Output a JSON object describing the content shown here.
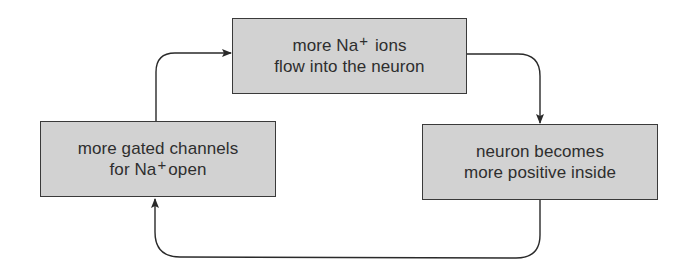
{
  "diagram": {
    "type": "positive-feedback-cycle",
    "nodes": [
      {
        "id": "top",
        "line1_pre": "more Na",
        "line1_sup": "+",
        "line1_post": " ions",
        "line2": "flow into the neuron"
      },
      {
        "id": "right",
        "line1": "neuron becomes",
        "line2": "more positive inside"
      },
      {
        "id": "left",
        "line1": "more gated channels",
        "line2_pre": "for Na",
        "line2_sup": "+",
        "line2_post": "open"
      }
    ],
    "edges": [
      {
        "from": "left",
        "to": "top"
      },
      {
        "from": "top",
        "to": "right"
      },
      {
        "from": "right",
        "to": "left"
      }
    ],
    "colors": {
      "box_fill": "#d2d2d2",
      "box_border": "#3a3a3a",
      "arrow": "#2a2a2a",
      "text": "#2e2e2e"
    }
  }
}
